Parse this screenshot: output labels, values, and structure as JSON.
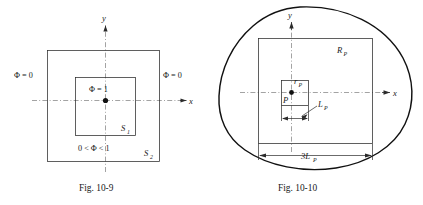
{
  "page": {
    "background_color": "#ffffff",
    "ink_color": "#1a1a1a",
    "width": 423,
    "height": 205
  },
  "figures": [
    {
      "id": "fig-10-9",
      "caption": "Fig. 10-9",
      "axis_x_label": "x",
      "axis_y_label": "y",
      "labels": {
        "phi_left": "Φ = 0",
        "phi_right": "Φ = 0",
        "phi_center": "Φ = 1",
        "phi_between": "0 < Φ < 1",
        "inner_surface": "S",
        "inner_surface_sub": "1",
        "outer_surface": "S",
        "outer_surface_sub": "2"
      }
    },
    {
      "id": "fig-10-10",
      "caption": "Fig. 10-10",
      "axis_x_label": "x",
      "axis_y_label": "y",
      "labels": {
        "outer_region": "R",
        "outer_region_sub": "P",
        "inner_radius": "r",
        "inner_radius_sub": "P",
        "point": "P",
        "side_length": "L",
        "side_length_sub": "P",
        "dimension": "3L",
        "dimension_sub": "P"
      }
    }
  ]
}
